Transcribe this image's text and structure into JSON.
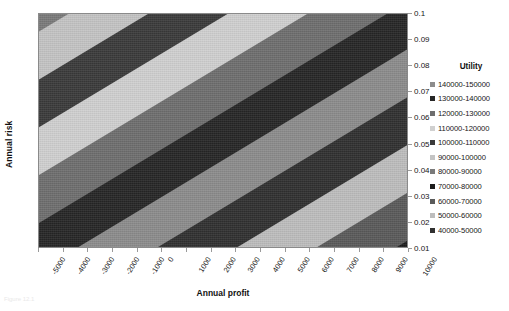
{
  "axes": {
    "x_title": "Annual profit",
    "y_title": "Annual risk"
  },
  "caption": "Figure 12.1",
  "legend": {
    "title": "Utility",
    "items": [
      {
        "label": "140000-150000",
        "color": "#8c8c8c"
      },
      {
        "label": "130000-140000",
        "color": "#262626"
      },
      {
        "label": "120000-130000",
        "color": "#6e6e6e"
      },
      {
        "label": "110000-120000",
        "color": "#d0d0d0"
      },
      {
        "label": "100000-110000",
        "color": "#3a3a3a"
      },
      {
        "label": "90000-100000",
        "color": "#c4c4c4"
      },
      {
        "label": "80000-90000",
        "color": "#7a7a7a"
      },
      {
        "label": "70000-80000",
        "color": "#1c1c1c"
      },
      {
        "label": "60000-70000",
        "color": "#5a5a5a"
      },
      {
        "label": "50000-60000",
        "color": "#bdbdbd"
      },
      {
        "label": "40000-50000",
        "color": "#303030"
      }
    ]
  },
  "chart_data": {
    "type": "heatmap",
    "title": "",
    "subtitle": "",
    "xlabel": "Annual profit",
    "ylabel": "Annual risk",
    "x": [
      -5000,
      -4000,
      -3000,
      -2000,
      -1000,
      0,
      1000,
      2000,
      3000,
      4000,
      5000,
      6000,
      7000,
      8000,
      9000,
      10000
    ],
    "y": [
      0.01,
      0.02,
      0.03,
      0.04,
      0.05,
      0.06,
      0.07,
      0.08,
      0.09,
      0.1
    ],
    "xlim": [
      -5000,
      10000
    ],
    "ylim": [
      0.01,
      0.1
    ],
    "xtick_labels": [
      "-5000",
      "-4000",
      "-3000",
      "-2000",
      "-1000",
      "0",
      "1000",
      "2000",
      "3000",
      "4000",
      "5000",
      "6000",
      "7000",
      "8000",
      "9000",
      "10000"
    ],
    "ytick_labels": [
      "0.1",
      "0.09",
      "0.08",
      "0.07",
      "0.06",
      "0.05",
      "0.04",
      "0.03",
      "0.02",
      "0.01"
    ],
    "grid": false,
    "legend_position": "right",
    "legend_title": "Utility",
    "zlabel": "Utility",
    "bands": [
      {
        "range": "40000-50000",
        "min": 40000,
        "max": 50000,
        "color": "#303030"
      },
      {
        "range": "50000-60000",
        "min": 50000,
        "max": 60000,
        "color": "#bdbdbd"
      },
      {
        "range": "60000-70000",
        "min": 60000,
        "max": 70000,
        "color": "#5a5a5a"
      },
      {
        "range": "70000-80000",
        "min": 70000,
        "max": 80000,
        "color": "#1c1c1c"
      },
      {
        "range": "80000-90000",
        "min": 80000,
        "max": 90000,
        "color": "#7a7a7a"
      },
      {
        "range": "90000-100000",
        "min": 90000,
        "max": 100000,
        "color": "#c4c4c4"
      },
      {
        "range": "100000-110000",
        "min": 100000,
        "max": 110000,
        "color": "#3a3a3a"
      },
      {
        "range": "110000-120000",
        "min": 110000,
        "max": 120000,
        "color": "#d0d0d0"
      },
      {
        "range": "120000-130000",
        "min": 120000,
        "max": 130000,
        "color": "#6e6e6e"
      },
      {
        "range": "130000-140000",
        "min": 130000,
        "max": 140000,
        "color": "#262626"
      },
      {
        "range": "140000-150000",
        "min": 140000,
        "max": 150000,
        "color": "#8c8c8c"
      }
    ],
    "surface_stripes": [
      {
        "offset_pct": 0,
        "width_pct": 7,
        "color": "#1c1c1c"
      },
      {
        "offset_pct": 7,
        "width_pct": 8,
        "color": "#7a7a7a"
      },
      {
        "offset_pct": 15,
        "width_pct": 8,
        "color": "#c4c4c4"
      },
      {
        "offset_pct": 23,
        "width_pct": 8,
        "color": "#3a3a3a"
      },
      {
        "offset_pct": 31,
        "width_pct": 8,
        "color": "#d0d0d0"
      },
      {
        "offset_pct": 39,
        "width_pct": 8,
        "color": "#6e6e6e"
      },
      {
        "offset_pct": 47,
        "width_pct": 8,
        "color": "#262626"
      },
      {
        "offset_pct": 55,
        "width_pct": 8,
        "color": "#8c8c8c"
      },
      {
        "offset_pct": 63,
        "width_pct": 8,
        "color": "#303030"
      },
      {
        "offset_pct": 71,
        "width_pct": 8,
        "color": "#bdbdbd"
      },
      {
        "offset_pct": 79,
        "width_pct": 8,
        "color": "#5a5a5a"
      },
      {
        "offset_pct": 87,
        "width_pct": 7,
        "color": "#1c1c1c"
      },
      {
        "offset_pct": 94,
        "width_pct": 6,
        "color": "#7a7a7a"
      }
    ]
  }
}
